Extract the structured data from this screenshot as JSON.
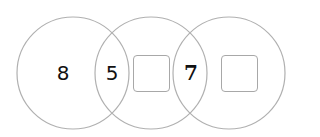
{
  "diagram": {
    "type": "three overlapping circles chain",
    "circles": [
      {
        "id": "circle-1",
        "cx": 73,
        "cy": 73,
        "r": 56
      },
      {
        "id": "circle-2",
        "cx": 151,
        "cy": 73,
        "r": 56
      },
      {
        "id": "circle-3",
        "cx": 229,
        "cy": 73,
        "r": 56
      }
    ],
    "stroke_color": "#b0b0b0",
    "labels": {
      "circle1_only": "8",
      "overlap_1_2": "5",
      "overlap_2_3": "7"
    },
    "answer_boxes": [
      {
        "id": "circle2-only-box",
        "value": ""
      },
      {
        "id": "circle3-only-box",
        "value": ""
      }
    ]
  }
}
